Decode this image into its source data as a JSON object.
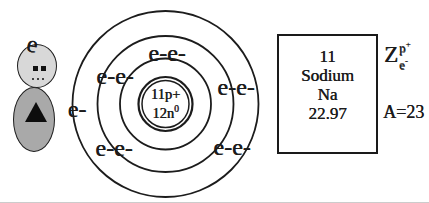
{
  "page": {
    "background": "#ffffff",
    "ink": "#1c1c1c"
  },
  "mini_figure": {
    "head_label": "e",
    "head_fill": "#d8d8d8",
    "body_fill": "#a9a9a9"
  },
  "bohr_model": {
    "element": "Sodium",
    "shell_count": 3,
    "electron_configuration": "2-8-1",
    "nucleus": {
      "line1": "11p+",
      "line2_base": "12n",
      "line2_sup": "0"
    },
    "electron_labels": [
      {
        "text": "e-e-",
        "shell": 1,
        "position": "top"
      },
      {
        "text": "e-e-",
        "shell": 2,
        "position": "upper-left"
      },
      {
        "text": "e-e-",
        "shell": 2,
        "position": "upper-right"
      },
      {
        "text": "e-",
        "shell": 3,
        "position": "left"
      },
      {
        "text": "e-e-",
        "shell": 2,
        "position": "lower-left"
      },
      {
        "text": "e-e-",
        "shell": 2,
        "position": "lower-right"
      }
    ]
  },
  "element_box": {
    "atomic_number": "11",
    "name": "Sodium",
    "symbol": "Na",
    "atomic_mass": "22.97"
  },
  "annotations": {
    "z_symbol": "Z",
    "z_top_base": "p",
    "z_top_sup": "+",
    "z_bottom_base": "e",
    "z_bottom_sup": "-",
    "mass_number": "A=23"
  }
}
